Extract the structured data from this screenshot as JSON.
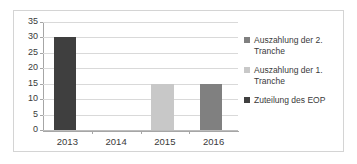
{
  "chart_data": {
    "type": "bar",
    "title": "",
    "xlabel": "",
    "ylabel": "",
    "ylim": [
      0,
      35
    ],
    "ytick_step": 5,
    "grid": true,
    "legend_position": "right",
    "categories": [
      "2013",
      "2014",
      "2015",
      "2016"
    ],
    "ytick_labels": [
      "35",
      "30",
      "25",
      "20",
      "15",
      "10",
      "5",
      "0"
    ],
    "series": [
      {
        "name": "Auszahlung der 2. Tranche",
        "color": "#808080",
        "values": [
          0,
          0,
          0,
          15
        ]
      },
      {
        "name": "Auszahlung der 1. Tranche",
        "color": "#c8c8c8",
        "values": [
          0,
          0,
          15,
          0
        ]
      },
      {
        "name": "Zuteilung des EOP",
        "color": "#3f3f3f",
        "values": [
          30,
          0,
          0,
          0
        ]
      }
    ],
    "bars": [
      {
        "category": "2013",
        "value": 30,
        "series": "Zuteilung des EOP",
        "color": "#3f3f3f"
      },
      {
        "category": "2015",
        "value": 15,
        "series": "Auszahlung der 1. Tranche",
        "color": "#c8c8c8"
      },
      {
        "category": "2016",
        "value": 15,
        "series": "Auszahlung der 2. Tranche",
        "color": "#808080"
      }
    ]
  },
  "legend": {
    "entries": [
      {
        "label_line1": "Auszahlung der 2.",
        "label_line2": "Tranche",
        "color": "#808080"
      },
      {
        "label_line1": "Auszahlung der 1.",
        "label_line2": "Tranche",
        "color": "#c8c8c8"
      },
      {
        "label_line1": "Zuteilung des EOP",
        "label_line2": "",
        "color": "#3f3f3f"
      }
    ]
  },
  "colors": {
    "frame_border": "#d4d4d4",
    "gridline": "#d9d9d9",
    "axis_line": "#a6a6a6",
    "text": "#3a3a3a",
    "background": "#ffffff"
  }
}
